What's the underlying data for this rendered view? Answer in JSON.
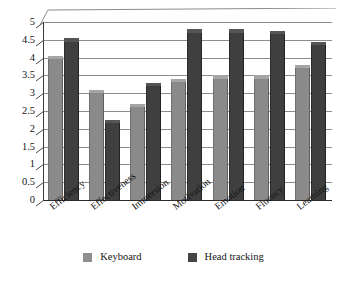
{
  "chart_data": {
    "type": "bar",
    "title": "",
    "subtitle": "",
    "xlabel": "",
    "ylabel": "",
    "ylim": [
      0,
      5
    ],
    "ytick_step": 0.5,
    "grid": true,
    "legend_position": "bottom",
    "categories": [
      "Efficiency",
      "Effectiveness",
      "Immersion",
      "Motivation",
      "Emotion",
      "Fluency",
      "Learning"
    ],
    "yticks": [
      "0",
      "0.5",
      "1",
      "1.5",
      "2",
      "2.5",
      "3",
      "3.5",
      "4",
      "4.5",
      "5"
    ],
    "series": [
      {
        "name": "Keyboard",
        "color": "#8a8a8a",
        "values": [
          4.05,
          3.1,
          2.7,
          3.4,
          3.5,
          3.5,
          3.8
        ]
      },
      {
        "name": "Head tracking",
        "color": "#3f3f3f",
        "values": [
          4.55,
          2.25,
          3.3,
          4.8,
          4.8,
          4.75,
          4.45
        ]
      }
    ]
  },
  "legend": {
    "items": [
      {
        "label": "Keyboard",
        "swatch": "keyboard-swatch"
      },
      {
        "label": "Head tracking",
        "swatch": "head-tracking-swatch"
      }
    ]
  }
}
